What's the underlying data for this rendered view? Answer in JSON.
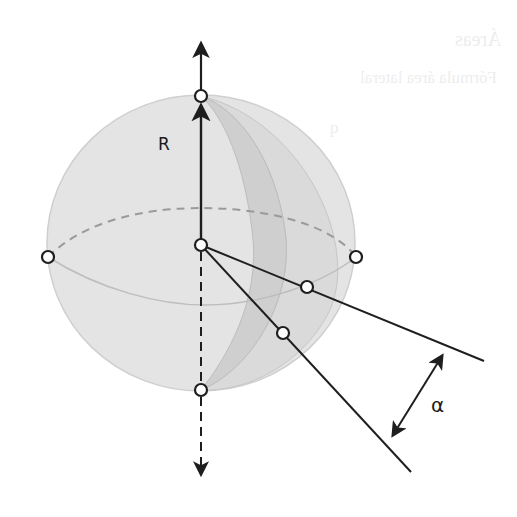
{
  "figure": {
    "labels": {
      "radius": "R",
      "angle": "α"
    },
    "bleed_through_text": [
      "Áreas",
      "Fórmula área lateral",
      "q",
      "πR"
    ],
    "colors": {
      "sphere_fill": "#e4e4e4",
      "lune_fill": "#d2d2d2",
      "lines": "#1e1e1e",
      "dashed_equator": "#9a9a9a",
      "background": "#ffffff"
    },
    "geometry": {
      "sphere_center": [
        201,
        245
      ],
      "sphere_radius_x": 154,
      "sphere_radius_y": 147,
      "top_pole": [
        201,
        96
      ],
      "bottom_pole": [
        201,
        390
      ],
      "equator_left": [
        48,
        257
      ],
      "equator_right": [
        356,
        257
      ],
      "lune_point_1": [
        307,
        287
      ],
      "lune_point_2": [
        283,
        333
      ],
      "ray_1_end": [
        484,
        361
      ],
      "ray_2_end": [
        411,
        472
      ]
    }
  }
}
